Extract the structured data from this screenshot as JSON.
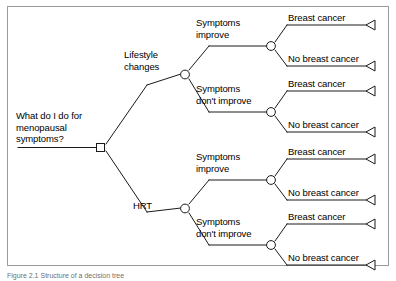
{
  "figure": {
    "caption": "Figure 2.1  Structure of a decision tree",
    "border_color": "#9a9a9a",
    "line_color": "#1a1a1a",
    "background": "#ffffff"
  },
  "tree": {
    "root": {
      "node_type": "decision-square",
      "label": "What do I do for\nmenopausal\nsymptoms?"
    },
    "branches": [
      {
        "label": "Lifestyle\nchanges",
        "node_type": "chance-circle",
        "outcomes": [
          {
            "label": "Symptoms\nimprove",
            "node_type": "chance-circle",
            "terminals": [
              {
                "label": "Breast cancer",
                "node_type": "terminal-triangle"
              },
              {
                "label": "No breast cancer",
                "node_type": "terminal-triangle"
              }
            ]
          },
          {
            "label": "Symptoms\ndon't improve",
            "node_type": "chance-circle",
            "terminals": [
              {
                "label": "Breast cancer",
                "node_type": "terminal-triangle"
              },
              {
                "label": "No breast cancer",
                "node_type": "terminal-triangle"
              }
            ]
          }
        ]
      },
      {
        "label": "HRT",
        "node_type": "chance-circle",
        "outcomes": [
          {
            "label": "Symptoms\nimprove",
            "node_type": "chance-circle",
            "terminals": [
              {
                "label": "Breast cancer",
                "node_type": "terminal-triangle"
              },
              {
                "label": "No breast cancer",
                "node_type": "terminal-triangle"
              }
            ]
          },
          {
            "label": "Symptoms\ndon't improve",
            "node_type": "chance-circle",
            "terminals": [
              {
                "label": "Breast cancer",
                "node_type": "terminal-triangle"
              },
              {
                "label": "No breast cancer",
                "node_type": "terminal-triangle"
              }
            ]
          }
        ]
      }
    ]
  }
}
